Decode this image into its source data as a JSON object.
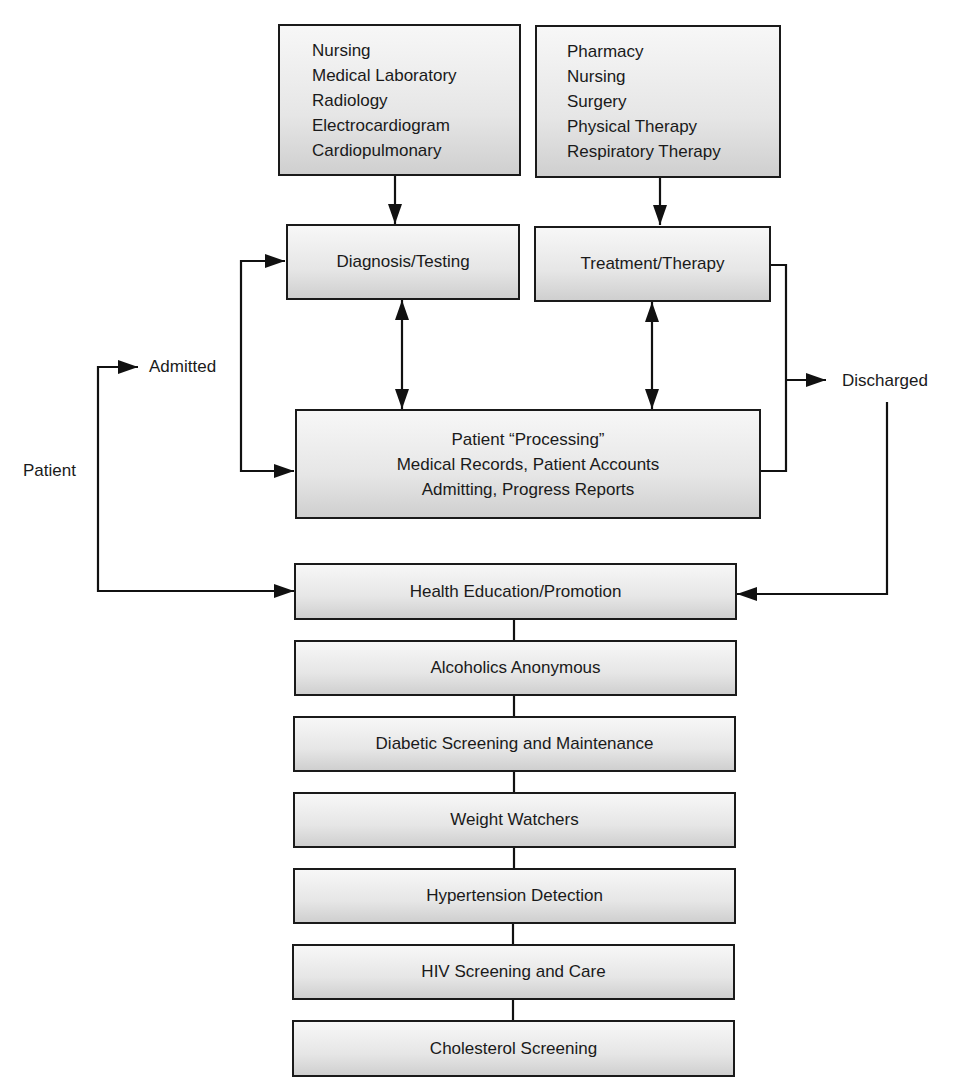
{
  "diagram": {
    "support_departments_diagnostic": [
      "Nursing",
      "Medical Laboratory",
      "Radiology",
      "Electrocardiogram",
      "Cardiopulmonary"
    ],
    "support_departments_therapeutic": [
      "Pharmacy",
      "Nursing",
      "Surgery",
      "Physical Therapy",
      "Respiratory Therapy"
    ],
    "diagnosis_testing": "Diagnosis/Testing",
    "treatment_therapy": "Treatment/Therapy",
    "patient_processing": {
      "title": "Patient “Processing”",
      "line2": "Medical Records, Patient Accounts",
      "line3": "Admitting, Progress Reports"
    },
    "labels": {
      "patient": "Patient",
      "admitted": "Admitted",
      "discharged": "Discharged"
    },
    "community_programs": [
      "Health Education/Promotion",
      "Alcoholics Anonymous",
      "Diabetic Screening and Maintenance",
      "Weight Watchers",
      "Hypertension Detection",
      "HIV Screening and Care",
      "Cholesterol Screening"
    ]
  }
}
